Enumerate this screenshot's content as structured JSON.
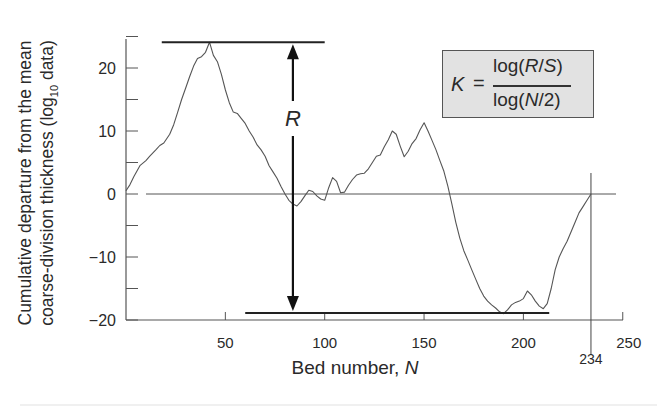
{
  "chart_data": {
    "type": "line",
    "title": "",
    "xlabel": "Bed number, N",
    "xlabel_parts": {
      "text": "Bed number, ",
      "italic": "N"
    },
    "ylabel_line1": "Cumulative departure from the mean",
    "ylabel_line2": "coarse-division thickness (log",
    "ylabel_sub": "10",
    "ylabel_tail": " data)",
    "xlim": [
      0,
      250
    ],
    "ylim": [
      -20,
      25
    ],
    "x_ticks": [
      50,
      100,
      150,
      200,
      250
    ],
    "x_tick_labels": [
      "50",
      "100",
      "150",
      "200",
      "250"
    ],
    "y_ticks_major": [
      -20,
      -10,
      0,
      10,
      20
    ],
    "y_tick_labels": [
      "-20",
      "-10",
      "0",
      "10",
      "20"
    ],
    "y_ticks_minor": [
      -15,
      -5,
      5,
      15,
      25
    ],
    "grid": false,
    "legend": null,
    "zero_line": true,
    "end_marker": {
      "x": 234,
      "label": "234"
    },
    "annotations": {
      "range_label": "R",
      "max_line": {
        "y": 24.1,
        "x_from": 18,
        "x_to": 100
      },
      "min_line": {
        "y": -18.9,
        "x_from": 60,
        "x_to": 213
      },
      "arrow_x": 84,
      "formula": {
        "lhs": "K",
        "equals": "=",
        "numerator": "log(R/S)",
        "denominator": "log(N/2)"
      }
    },
    "series": [
      {
        "name": "cumulative departure",
        "x": [
          0,
          2,
          4,
          7,
          10,
          12,
          15,
          17,
          19,
          22,
          24,
          26,
          28,
          30,
          32,
          34,
          36,
          38,
          40,
          41,
          42,
          44,
          46,
          48,
          50,
          52,
          54,
          56,
          58,
          60,
          62,
          64,
          66,
          68,
          70,
          72,
          74,
          76,
          78,
          80,
          82,
          84,
          86,
          88,
          90,
          92,
          94,
          96,
          98,
          100,
          102,
          104,
          106,
          108,
          110,
          112,
          114,
          116,
          118,
          120,
          122,
          124,
          126,
          128,
          130,
          132,
          134,
          136,
          138,
          140,
          142,
          144,
          146,
          148,
          150,
          152,
          154,
          156,
          158,
          160,
          162,
          164,
          166,
          168,
          170,
          172,
          174,
          176,
          178,
          180,
          182,
          184,
          186,
          188,
          190,
          192,
          194,
          196,
          198,
          200,
          202,
          204,
          206,
          208,
          210,
          212,
          214,
          216,
          218,
          220,
          222,
          224,
          226,
          228,
          230,
          232,
          234
        ],
        "y": [
          0.5,
          1.5,
          2.8,
          4.5,
          5.3,
          6.0,
          7.0,
          7.7,
          8.1,
          9.5,
          11.0,
          13.0,
          15.0,
          16.8,
          18.6,
          20.3,
          21.5,
          21.8,
          22.5,
          23.3,
          24.1,
          22.0,
          21.0,
          19.0,
          16.5,
          14.5,
          13.0,
          12.8,
          12.0,
          11.2,
          10.0,
          9.0,
          7.8,
          7.0,
          6.0,
          4.5,
          3.5,
          2.5,
          1.2,
          0.0,
          -1.0,
          -1.6,
          -1.9,
          -1.2,
          -0.3,
          0.6,
          0.4,
          -0.3,
          -0.8,
          -1.0,
          1.0,
          2.6,
          2.0,
          0.2,
          0.3,
          1.4,
          2.3,
          3.0,
          3.2,
          3.3,
          4.0,
          5.0,
          6.0,
          6.2,
          7.5,
          8.6,
          10.0,
          9.5,
          7.6,
          5.9,
          6.8,
          8.0,
          8.8,
          10.2,
          11.3,
          10.0,
          8.5,
          7.0,
          5.3,
          3.6,
          1.2,
          -1.6,
          -4.5,
          -7.0,
          -9.0,
          -10.5,
          -12.0,
          -13.5,
          -15.0,
          -16.2,
          -17.0,
          -17.6,
          -18.1,
          -18.7,
          -19.0,
          -18.4,
          -17.6,
          -17.2,
          -17.0,
          -16.6,
          -15.4,
          -16.0,
          -17.0,
          -17.8,
          -18.2,
          -17.4,
          -15.0,
          -12.0,
          -10.0,
          -8.7,
          -7.5,
          -6.0,
          -4.5,
          -3.0,
          -2.0,
          -1.0,
          0.0
        ]
      }
    ]
  }
}
